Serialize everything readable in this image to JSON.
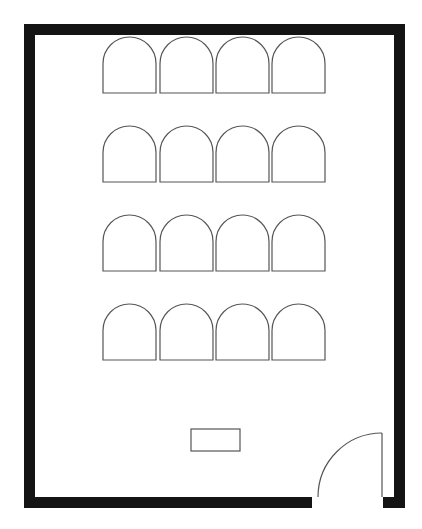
{
  "diagram": {
    "type": "floor-plan",
    "canvas": {
      "width": 422,
      "height": 529,
      "background": "#ffffff"
    },
    "colors": {
      "wall": "#141414",
      "outline": "#555555"
    },
    "room": {
      "outer": {
        "x": 24,
        "y": 24,
        "w": 381,
        "h": 484
      },
      "wall_thickness": 11
    },
    "door": {
      "wall": "bottom",
      "opening_x_start": 312,
      "opening_x_end": 383,
      "hinge": {
        "x": 382,
        "y": 498
      },
      "leaf_top_y": 433,
      "swing": "inward"
    },
    "seating": {
      "rows": 4,
      "per_row": 4,
      "chair_width": 53,
      "chair_height": 56,
      "column_x": [
        103,
        160,
        216,
        272
      ],
      "row_y": [
        37,
        126,
        215,
        304
      ]
    },
    "desk": {
      "x": 191,
      "y": 429,
      "w": 49,
      "h": 22
    }
  }
}
